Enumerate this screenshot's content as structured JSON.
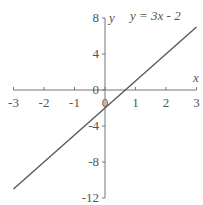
{
  "chart_data": {
    "type": "line",
    "title": "y = 3x - 2",
    "xlabel": "x",
    "ylabel": "y",
    "xlim": [
      -3,
      3
    ],
    "ylim": [
      -12,
      8
    ],
    "x_ticks": [
      -3,
      -2,
      -1,
      0,
      1,
      2,
      3
    ],
    "y_ticks": [
      8,
      4,
      0,
      -4,
      -8,
      -12
    ],
    "x_tick_labels": [
      "-3",
      "-2",
      "-1",
      "0",
      "1",
      "2",
      "3"
    ],
    "y_tick_labels": [
      "8",
      "4",
      "0",
      "-4",
      "-8",
      "-12"
    ],
    "grid": false,
    "series": [
      {
        "name": "y = 3x - 2",
        "x": [
          -3,
          3
        ],
        "y": [
          -11,
          7
        ],
        "color": "#555555"
      }
    ]
  }
}
